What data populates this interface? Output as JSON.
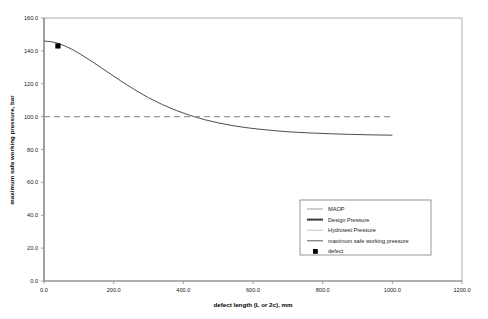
{
  "chart_data": {
    "type": "line",
    "title": "",
    "xlabel": "defect length (L or 2c), mm",
    "ylabel": "maximum safe working pressure, bar",
    "xlim": [
      0.0,
      1200.0
    ],
    "ylim": [
      0.0,
      160.0
    ],
    "xticks": [
      "0.0",
      "200.0",
      "400.0",
      "600.0",
      "800.0",
      "1000.0",
      "1200.0"
    ],
    "yticks": [
      "0.0",
      "20.0",
      "40.0",
      "60.0",
      "80.0",
      "100.0",
      "120.0",
      "140.0",
      "160.0"
    ],
    "grid": false,
    "legend_position": "lower-right",
    "series": [
      {
        "name": "maximum safe working pressure",
        "style": "solid",
        "color": "#4d4d4d",
        "x": [
          0,
          20,
          40,
          60,
          80,
          100,
          140,
          180,
          220,
          260,
          300,
          340,
          380,
          420,
          460,
          500,
          540,
          580,
          620,
          660,
          700,
          760,
          820,
          880,
          940,
          1000
        ],
        "y": [
          146.0,
          145.6,
          144.6,
          143.0,
          141.0,
          138.6,
          133.2,
          127.5,
          121.8,
          116.4,
          111.5,
          107.3,
          103.7,
          100.7,
          98.2,
          96.2,
          94.6,
          93.3,
          92.3,
          91.5,
          90.8,
          90.1,
          89.6,
          89.2,
          88.9,
          88.7
        ]
      },
      {
        "name": "MAOP",
        "style": "dashed",
        "color": "#9b9b9b",
        "value": 100.0,
        "x": [
          0,
          1000
        ],
        "y": [
          100.0,
          100.0
        ]
      }
    ],
    "points": [
      {
        "name": "defect",
        "marker": "square",
        "color": "#000000",
        "x": 40.0,
        "y": 143.0
      }
    ],
    "annotations": []
  },
  "legend": {
    "entries": [
      {
        "label": "MAOP",
        "swatch": "line",
        "color": "#9b9b9b",
        "thickness": 1
      },
      {
        "label": "Design Pressure",
        "swatch": "line",
        "color": "#3a3a3a",
        "thickness": 2
      },
      {
        "label": "Hydrotest Pressure",
        "swatch": "line",
        "color": "#c4c4c4",
        "thickness": 1
      },
      {
        "label": "maximum safe working pressure",
        "swatch": "line",
        "color": "#5a5a5a",
        "thickness": 1
      },
      {
        "label": "defect",
        "swatch": "square",
        "color": "#000000",
        "thickness": 0
      }
    ]
  },
  "colors": {
    "frame": "#9a9a9a",
    "axis": "#8a8a8a",
    "curve": "#4d4d4d",
    "maop": "#9b9b9b",
    "marker": "#000000",
    "text": "#1a1a1a",
    "legend_border": "#6a6a6a",
    "background": "#ffffff"
  }
}
